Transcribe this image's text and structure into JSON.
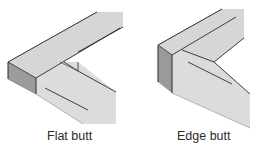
{
  "figures": [
    {
      "id": "flat-butt",
      "caption": "Flat butt",
      "description": "Isometric drawing of two boards meeting at a right angle, joined flat face to end grain (flat butt joint)"
    },
    {
      "id": "edge-butt",
      "caption": "Edge butt",
      "description": "Isometric drawing of two boards meeting at a right angle, joined edge to end grain (edge butt joint)"
    }
  ],
  "colors": {
    "face_light": "#d9d9d9",
    "face_top": "#d2d2d2",
    "end_grain": "#9a9a9a",
    "outline": "#2b2b2b",
    "caption_text": "#2a2a2a",
    "background": "#ffffff"
  }
}
